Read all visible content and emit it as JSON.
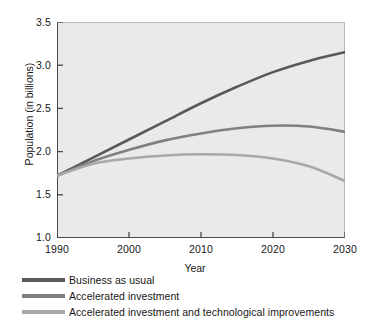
{
  "chart_data": {
    "type": "line",
    "title": "",
    "xlabel": "Year",
    "ylabel": "Population (in billions)",
    "xlim": [
      1990,
      2030
    ],
    "ylim": [
      1.0,
      3.5
    ],
    "xticks": [
      "1990",
      "2000",
      "2010",
      "2020",
      "2030"
    ],
    "yticks": [
      "3.5",
      "3.0",
      "2.5",
      "2.0",
      "1.5",
      "1.0"
    ],
    "grid": false,
    "legend_position": "below-axes-left",
    "plot_background": "#eaeaea",
    "x": [
      1990,
      1995,
      2000,
      2005,
      2010,
      2015,
      2020,
      2025,
      2030
    ],
    "series": [
      {
        "name": "Business as usual",
        "color": "#595959",
        "values": [
          1.72,
          1.93,
          2.14,
          2.35,
          2.56,
          2.75,
          2.92,
          3.05,
          3.15
        ]
      },
      {
        "name": "Accelerated investment",
        "color": "#808080",
        "values": [
          1.72,
          1.89,
          2.02,
          2.13,
          2.21,
          2.27,
          2.3,
          2.29,
          2.23
        ]
      },
      {
        "name": "Accelerated investment and technological improvements",
        "color": "#a8a8a8",
        "values": [
          1.72,
          1.86,
          1.92,
          1.955,
          1.97,
          1.96,
          1.92,
          1.83,
          1.66
        ]
      }
    ]
  },
  "axes": {
    "ylabel": "Population (in billions)",
    "xlabel": "Year",
    "yticks": [
      {
        "value": "3.5"
      },
      {
        "value": "3.0"
      },
      {
        "value": "2.5"
      },
      {
        "value": "2.0"
      },
      {
        "value": "1.5"
      },
      {
        "value": "1.0"
      }
    ],
    "xticks": [
      {
        "value": "1990"
      },
      {
        "value": "2000"
      },
      {
        "value": "2010"
      },
      {
        "value": "2020"
      },
      {
        "value": "2030"
      }
    ]
  },
  "legend": {
    "items": [
      {
        "label": "Business as usual",
        "color": "#595959"
      },
      {
        "label": "Accelerated investment",
        "color": "#808080"
      },
      {
        "label": "Accelerated investment and technological improvements",
        "color": "#a8a8a8"
      }
    ]
  }
}
